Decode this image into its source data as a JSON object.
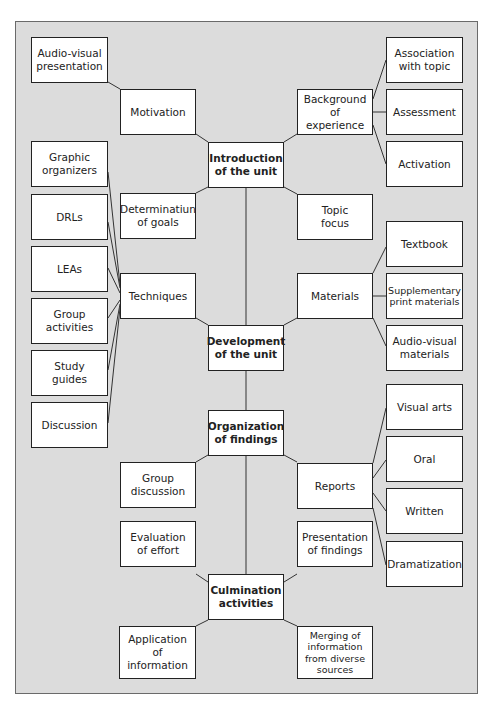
{
  "diagram": {
    "type": "hierarchical concept map",
    "main_nodes": [
      {
        "id": "intro",
        "label": "Introduction\nof the unit"
      },
      {
        "id": "dev",
        "label": "Development\nof the unit"
      },
      {
        "id": "org",
        "label": "Organization\nof findings"
      },
      {
        "id": "culm",
        "label": "Culmination\nactivities"
      }
    ],
    "nodes": {
      "audio_visual_presentation": "Audio-visual\npresentation",
      "motivation": "Motivation",
      "background": "Background\nof experience",
      "association": "Association\nwith topic",
      "assessment": "Assessment",
      "activation": "Activation",
      "graphic_organizers": "Graphic\norganizers",
      "drls": "DRLs",
      "leas": "LEAs",
      "group_activities": "Group\nactivities",
      "study_guides": "Study\nguides",
      "discussion": "Discussion",
      "determination": "Determinatiun\nof goals",
      "topic_focus": "Topic\nfocus",
      "techniques": "Techniques",
      "materials": "Materials",
      "textbook": "Textbook",
      "supplementary": "Supplementary\nprint materials",
      "av_materials": "Audio-visual\nmaterials",
      "visual_arts": "Visual arts",
      "oral": "Oral",
      "written": "Written",
      "dramatization": "Dramatization",
      "group_discussion": "Group\ndiscussion",
      "reports": "Reports",
      "evaluation": "Evaluation\nof effort",
      "presentation": "Presentation\nof findings",
      "application": "Application\nof\ninformation",
      "merging": "Merging of\ninformation\nfrom diverse\nsources"
    },
    "edges": [
      [
        "intro",
        "motivation"
      ],
      [
        "motivation",
        "audio_visual_presentation"
      ],
      [
        "intro",
        "background"
      ],
      [
        "background",
        "association"
      ],
      [
        "background",
        "assessment"
      ],
      [
        "background",
        "activation"
      ],
      [
        "intro",
        "determination"
      ],
      [
        "intro",
        "topic_focus"
      ],
      [
        "intro",
        "dev"
      ],
      [
        "dev",
        "techniques"
      ],
      [
        "techniques",
        "graphic_organizers"
      ],
      [
        "techniques",
        "drls"
      ],
      [
        "techniques",
        "leas"
      ],
      [
        "techniques",
        "group_activities"
      ],
      [
        "techniques",
        "study_guides"
      ],
      [
        "techniques",
        "discussion"
      ],
      [
        "dev",
        "materials"
      ],
      [
        "materials",
        "textbook"
      ],
      [
        "materials",
        "supplementary"
      ],
      [
        "materials",
        "av_materials"
      ],
      [
        "dev",
        "org"
      ],
      [
        "org",
        "group_discussion"
      ],
      [
        "org",
        "reports"
      ],
      [
        "reports",
        "visual_arts"
      ],
      [
        "reports",
        "oral"
      ],
      [
        "reports",
        "written"
      ],
      [
        "reports",
        "dramatization"
      ],
      [
        "org",
        "culm"
      ],
      [
        "culm",
        "evaluation"
      ],
      [
        "culm",
        "presentation"
      ],
      [
        "culm",
        "application"
      ],
      [
        "culm",
        "merging"
      ]
    ]
  }
}
